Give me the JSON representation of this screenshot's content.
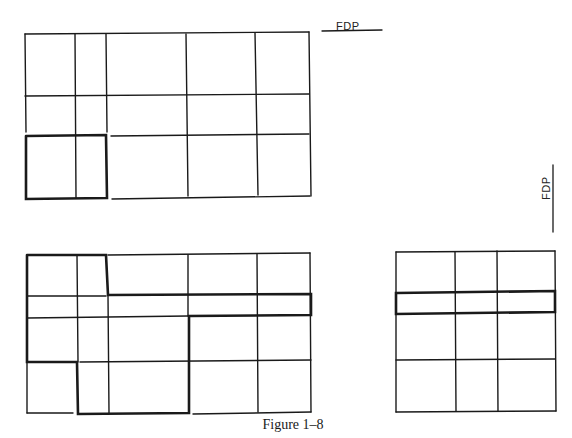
{
  "caption": "Figure 1–8",
  "labels": {
    "fdp_top": "FDP",
    "fdp_side": "FDP"
  },
  "colors": {
    "line": "#1a1a1a",
    "background": "#ffffff"
  },
  "figures": [
    {
      "id": "top-grid",
      "columns_x": [
        25,
        75,
        106,
        186,
        255,
        309
      ],
      "rows_y": [
        34,
        96,
        136,
        198
      ],
      "highlight": "bottom-left 2x1 block (cols 1-2, row 3)"
    },
    {
      "id": "bottom-left-grid",
      "columns_x": [
        27,
        77,
        108,
        188,
        257,
        311
      ],
      "rows_y": [
        255,
        296,
        317,
        362,
        413
      ],
      "highlight": "irregular polygon region"
    },
    {
      "id": "bottom-right-grid",
      "columns_x": [
        396,
        455,
        497,
        555
      ],
      "rows_y": [
        252,
        292,
        314,
        360,
        412
      ],
      "highlight": "second row strip"
    }
  ]
}
